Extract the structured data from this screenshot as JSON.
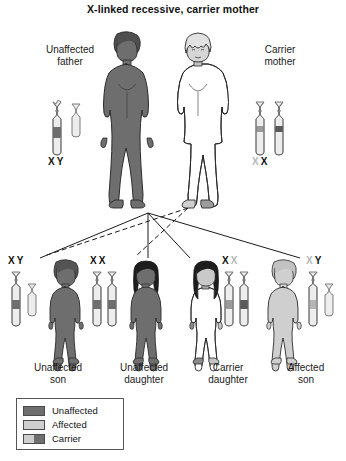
{
  "title": "X-linked recessive, carrier mother",
  "colors": {
    "unaffected": "#6e6e6e",
    "affected": "#cfcfcf",
    "carrier_light": "#cfcfcf",
    "carrier_dark": "#6e6e6e",
    "outline": "#2b2b2b",
    "band_unaffected": "#6e6e6e",
    "band_affected": "#9a9a9a",
    "chromosome_body": "#ededed",
    "text": "#111111",
    "text_faded": "#b7b7b7"
  },
  "parents": {
    "father": {
      "caption_line1": "Unaffected",
      "caption_line2": "father",
      "genotype": [
        {
          "symbol": "X",
          "state": "dark"
        },
        {
          "symbol": "Y",
          "state": "dark"
        }
      ],
      "status": "unaffected"
    },
    "mother": {
      "caption_line1": "Carrier",
      "caption_line2": "mother",
      "genotype": [
        {
          "symbol": "X",
          "state": "light"
        },
        {
          "symbol": "X",
          "state": "dark"
        }
      ],
      "status": "carrier"
    }
  },
  "children": [
    {
      "caption_line1": "Unaffected",
      "caption_line2": "son",
      "genotype": [
        {
          "symbol": "X",
          "state": "dark"
        },
        {
          "symbol": "Y",
          "state": "dark"
        }
      ],
      "status": "unaffected",
      "sex": "male"
    },
    {
      "caption_line1": "Unaffected",
      "caption_line2": "daughter",
      "genotype": [
        {
          "symbol": "X",
          "state": "dark"
        },
        {
          "symbol": "X",
          "state": "dark"
        }
      ],
      "status": "unaffected",
      "sex": "female"
    },
    {
      "caption_line1": "Carrier",
      "caption_line2": "daughter",
      "genotype": [
        {
          "symbol": "X",
          "state": "dark"
        },
        {
          "symbol": "X",
          "state": "light"
        }
      ],
      "status": "carrier",
      "sex": "female"
    },
    {
      "caption_line1": "Affected",
      "caption_line2": "son",
      "genotype": [
        {
          "symbol": "X",
          "state": "light"
        },
        {
          "symbol": "Y",
          "state": "dark"
        }
      ],
      "status": "affected",
      "sex": "male"
    }
  ],
  "legend": {
    "items": [
      {
        "label": "Unaffected",
        "swatch": "unaffected"
      },
      {
        "label": "Affected",
        "swatch": "affected"
      },
      {
        "label": "Carrier",
        "swatch": "carrier"
      }
    ]
  }
}
